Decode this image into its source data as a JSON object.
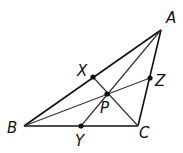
{
  "diagram": {
    "colors": {
      "line": "#111111",
      "point": "#111111",
      "background": "#ffffff"
    },
    "points": {
      "A": {
        "label": "A",
        "x": 161,
        "y": 30,
        "lx": 166,
        "ly": 23
      },
      "B": {
        "label": "B",
        "x": 24,
        "y": 126,
        "lx": 7,
        "ly": 133
      },
      "C": {
        "label": "C",
        "x": 138,
        "y": 126,
        "lx": 139,
        "ly": 138
      },
      "X": {
        "label": "X",
        "x": 93,
        "y": 77,
        "lx": 77,
        "ly": 76
      },
      "Y": {
        "label": "Y",
        "x": 81,
        "y": 126,
        "lx": 75,
        "ly": 145
      },
      "Z": {
        "label": "Z",
        "x": 150,
        "y": 78,
        "lx": 155,
        "ly": 86
      },
      "P": {
        "label": "P",
        "x": 107,
        "y": 94,
        "lx": 100,
        "ly": 113
      }
    },
    "labels": {
      "A": "A",
      "B": "B",
      "C": "C",
      "X": "X",
      "Y": "Y",
      "Z": "Z",
      "P": "P"
    },
    "segments": [
      [
        "A",
        "B"
      ],
      [
        "B",
        "C"
      ],
      [
        "C",
        "A"
      ],
      [
        "A",
        "Y"
      ],
      [
        "B",
        "Z"
      ],
      [
        "C",
        "X"
      ]
    ],
    "marked_points": [
      "X",
      "Y",
      "Z",
      "P"
    ]
  }
}
